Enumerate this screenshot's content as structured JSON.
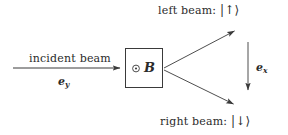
{
  "figure": {
    "type": "stern-gerlach-beam-splitting-diagram",
    "background_color": "#ffffff",
    "stroke_color": "#3a3a3a"
  },
  "labels": {
    "incident_beam": "incident beam",
    "incident_direction_vector": "e",
    "incident_direction_subscript": "y",
    "left_beam": "left beam:",
    "left_beam_ket": "|↑⟩",
    "right_beam": "right beam:",
    "right_beam_ket": "|↓⟩",
    "field_symbol": "B",
    "field_direction_icon": "⊙",
    "axis_vector": "e",
    "axis_vector_subscript": "x"
  },
  "geometry": {
    "box": {
      "x": 125,
      "y": 48,
      "width": 38,
      "height": 40
    },
    "incident_arrow": {
      "x1": 13,
      "y1": 68,
      "x2": 123,
      "y2": 68
    },
    "upper_arrow": {
      "x1": 164,
      "y1": 68,
      "x2": 238,
      "y2": 29
    },
    "lower_arrow": {
      "x1": 164,
      "y1": 70,
      "x2": 237,
      "y2": 106
    },
    "axis_arrow": {
      "x1": 248,
      "y1": 42,
      "x2": 248,
      "y2": 93
    }
  }
}
